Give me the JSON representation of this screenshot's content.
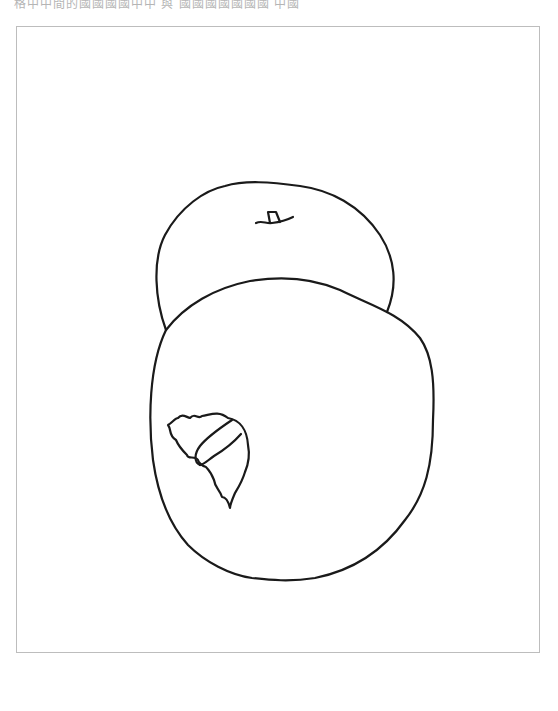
{
  "page": {
    "top_text": "格中中間的國國國國中中 與 國國國國國國國 中國"
  },
  "colors": {
    "background": "#ffffff",
    "line": "#1a1a1a",
    "frame": "#bdbdbd"
  }
}
